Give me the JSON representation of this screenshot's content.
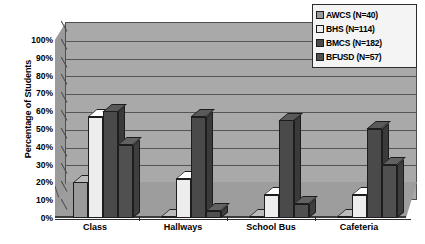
{
  "chart_data": {
    "type": "bar",
    "title": "",
    "subtitle": "",
    "xlabel": "",
    "ylabel": "Percentage of Students",
    "categories": [
      "Class",
      "Hallways",
      "School Bus",
      "Cafeteria"
    ],
    "series": [
      {
        "name": "AWCS (N=40)",
        "short": "AWCS",
        "n": 40,
        "color": "#9a9a9a",
        "values": [
          20,
          1,
          1,
          1
        ]
      },
      {
        "name": "BHS (N=114)",
        "short": "BHS",
        "n": 114,
        "color": "#ededed",
        "values": [
          57,
          22,
          13,
          13
        ]
      },
      {
        "name": "BMCS (N=182)",
        "short": "BMCS",
        "n": 182,
        "color": "#4a4a4a",
        "values": [
          60,
          57,
          55,
          50
        ]
      },
      {
        "name": "BFUSD (N=57)",
        "short": "BFUSD",
        "n": 57,
        "color": "#505050",
        "values": [
          41,
          4,
          8,
          30
        ]
      }
    ],
    "ylim": [
      0,
      100
    ],
    "ytick_values": [
      0,
      10,
      20,
      30,
      40,
      50,
      60,
      70,
      80,
      90,
      100
    ],
    "ytick_labels": [
      "0%",
      "10%",
      "20%",
      "30%",
      "40%",
      "50%",
      "60%",
      "70%",
      "80%",
      "90%",
      "100%"
    ],
    "grid": true,
    "legend_position": "top-right",
    "style": "3d-clustered-column",
    "plot_background": "#a9a9a9",
    "gridline_color": "#555555",
    "legend_background": "#f4f4f4"
  },
  "legend": {
    "items": [
      {
        "label": "AWCS (N=40)"
      },
      {
        "label": "BHS (N=114)"
      },
      {
        "label": "BMCS (N=182)"
      },
      {
        "label": "BFUSD (N=57)"
      }
    ]
  },
  "axes": {
    "y_title": "Percentage of Students",
    "y_labels": [
      "100%",
      "90%",
      "80%",
      "70%",
      "60%",
      "50%",
      "40%",
      "30%",
      "20%",
      "10%",
      "0%"
    ],
    "x_labels": [
      "Class",
      "Hallways",
      "School Bus",
      "Cafeteria"
    ]
  }
}
